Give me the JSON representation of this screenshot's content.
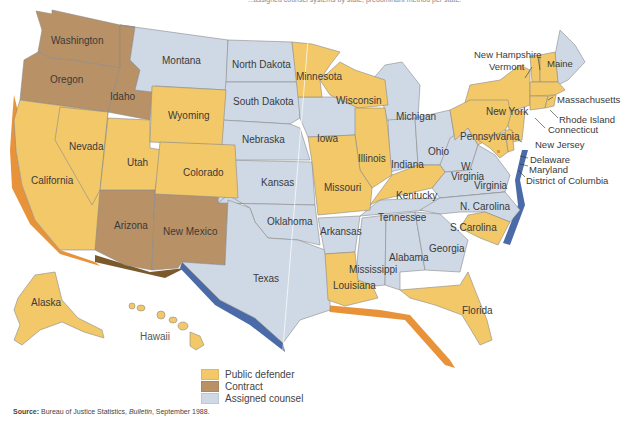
{
  "caption_fragment": "...assigned counsel systems by state; predominant method per state.",
  "colors": {
    "public_defender": "#f2c868",
    "contract": "#b99166",
    "assigned_counsel": "#cfd9e6",
    "coast_shadow_pd": "#e8923a",
    "coast_shadow_ac": "#4a6aa8"
  },
  "legend": {
    "items": [
      {
        "label": "Public defender",
        "color": "#f2c868"
      },
      {
        "label": "Contract",
        "color": "#b99166"
      },
      {
        "label": "Assigned counsel",
        "color": "#cfd9e6"
      }
    ]
  },
  "source": {
    "prefix": "Source:",
    "text_before": " Bureau of Justice Statistics, ",
    "publication": "Bulletin",
    "text_after": ", September 1988."
  },
  "states": {
    "washington": {
      "name": "Washington",
      "system": "Contract"
    },
    "oregon": {
      "name": "Oregon",
      "system": "Contract"
    },
    "idaho": {
      "name": "Idaho",
      "system": "Contract"
    },
    "montana": {
      "name": "Montana",
      "system": "Assigned counsel"
    },
    "north_dakota": {
      "name": "North Dakota",
      "system": "Assigned counsel"
    },
    "south_dakota": {
      "name": "South Dakota",
      "system": "Assigned counsel"
    },
    "minnesota": {
      "name": "Minnesota",
      "system": "Public defender"
    },
    "wisconsin": {
      "name": "Wisconsin",
      "system": "Public defender"
    },
    "michigan": {
      "name": "Michigan",
      "system": "Assigned counsel"
    },
    "wyoming": {
      "name": "Wyoming",
      "system": "Public defender"
    },
    "nebraska": {
      "name": "Nebraska",
      "system": "Assigned counsel"
    },
    "iowa": {
      "name": "Iowa",
      "system": "Assigned counsel"
    },
    "illinois": {
      "name": "Illinois",
      "system": "Public defender"
    },
    "indiana": {
      "name": "Indiana",
      "system": "Assigned counsel"
    },
    "ohio": {
      "name": "Ohio",
      "system": "Assigned counsel"
    },
    "nevada": {
      "name": "Nevada",
      "system": "Public defender"
    },
    "utah": {
      "name": "Utah",
      "system": "Public defender"
    },
    "colorado": {
      "name": "Colorado",
      "system": "Public defender"
    },
    "california": {
      "name": "California",
      "system": "Public defender"
    },
    "kansas": {
      "name": "Kansas",
      "system": "Assigned counsel"
    },
    "missouri": {
      "name": "Missouri",
      "system": "Public defender"
    },
    "kentucky": {
      "name": "Kentucky",
      "system": "Public defender"
    },
    "west_virginia": {
      "name": "W. Virginia",
      "system": "Assigned counsel"
    },
    "virginia": {
      "name": "Virginia",
      "system": "Assigned counsel"
    },
    "arizona": {
      "name": "Arizona",
      "system": "Contract"
    },
    "new_mexico": {
      "name": "New Mexico",
      "system": "Contract"
    },
    "oklahoma": {
      "name": "Oklahoma",
      "system": "Assigned counsel"
    },
    "arkansas": {
      "name": "Arkansas",
      "system": "Assigned counsel"
    },
    "tennessee": {
      "name": "Tennessee",
      "system": "Assigned counsel"
    },
    "north_carolina": {
      "name": "N. Carolina",
      "system": "Assigned counsel"
    },
    "south_carolina": {
      "name": "S.Carolina",
      "system": "Public defender"
    },
    "texas": {
      "name": "Texas",
      "system": "Assigned counsel"
    },
    "louisiana": {
      "name": "Louisiana",
      "system": "Public defender"
    },
    "mississippi": {
      "name": "Mississippi",
      "system": "Assigned counsel"
    },
    "alabama": {
      "name": "Alabama",
      "system": "Assigned counsel"
    },
    "georgia": {
      "name": "Georgia",
      "system": "Assigned counsel"
    },
    "florida": {
      "name": "Florida",
      "system": "Public defender"
    },
    "alaska": {
      "name": "Alaska",
      "system": "Public defender"
    },
    "hawaii": {
      "name": "Hawaii",
      "system": "Public defender"
    },
    "new_york": {
      "name": "New York",
      "system": "Public defender"
    },
    "pennsylvania": {
      "name": "Pennsylvania",
      "system": "Public defender"
    },
    "vermont": {
      "name": "Vermont",
      "system": "Public defender"
    },
    "new_hampshire": {
      "name": "New Hampshire",
      "system": "Public defender"
    },
    "maine": {
      "name": "Maine",
      "system": "Assigned counsel"
    },
    "massachusetts": {
      "name": "Massachusetts",
      "system": "Public defender"
    },
    "rhode_island": {
      "name": "Rhode Island",
      "system": "Public defender"
    },
    "connecticut": {
      "name": "Connecticut",
      "system": "Public defender"
    },
    "new_jersey": {
      "name": "New Jersey",
      "system": "Public defender"
    },
    "delaware": {
      "name": "Delaware",
      "system": "Public defender"
    },
    "maryland": {
      "name": "Maryland",
      "system": "Public defender"
    },
    "district_of_columbia": {
      "name": "District of Columbia",
      "system": "Public defender"
    }
  },
  "west_virginia_label": {
    "line1": "W.",
    "line2": "Virginia"
  }
}
